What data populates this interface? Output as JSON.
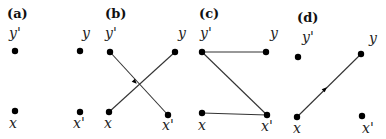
{
  "panels": [
    {
      "id": "a",
      "label": "(a)",
      "label_pos": [
        7,
        18
      ],
      "nodes": [
        {
          "name": "y'",
          "x": 15,
          "y": 51,
          "lx": 9,
          "ly": 38
        },
        {
          "name": "y",
          "x": 80,
          "y": 51,
          "lx": 82,
          "ly": 38
        },
        {
          "name": "x",
          "x": 15,
          "y": 111,
          "lx": 9,
          "ly": 128
        },
        {
          "name": "x'",
          "x": 80,
          "y": 112,
          "lx": 73,
          "ly": 128
        }
      ],
      "edges": []
    },
    {
      "id": "b",
      "label": "(b)",
      "label_pos": [
        105,
        18
      ],
      "nodes": [
        {
          "name": "y'",
          "x": 110,
          "y": 52,
          "lx": 105,
          "ly": 38
        },
        {
          "name": "y",
          "x": 175,
          "y": 52,
          "lx": 178,
          "ly": 38
        },
        {
          "name": "x",
          "x": 109,
          "y": 112,
          "lx": 104,
          "ly": 128
        },
        {
          "name": "x'",
          "x": 168,
          "y": 115,
          "lx": 162,
          "ly": 130
        }
      ],
      "edges": [
        {
          "from": "y'",
          "to": "x'",
          "arrow_at": [
            135,
            82
          ]
        },
        {
          "from": "x",
          "to": "y",
          "arrow_at": null
        }
      ]
    },
    {
      "id": "c",
      "label": "(c)",
      "label_pos": [
        199,
        18
      ],
      "nodes": [
        {
          "name": "y'",
          "x": 202,
          "y": 52,
          "lx": 200,
          "ly": 38
        },
        {
          "name": "y",
          "x": 266,
          "y": 52,
          "lx": 270,
          "ly": 38
        },
        {
          "name": "x",
          "x": 202,
          "y": 113,
          "lx": 198,
          "ly": 130
        },
        {
          "name": "x'",
          "x": 267,
          "y": 115,
          "lx": 261,
          "ly": 131
        }
      ],
      "edges": [
        {
          "from": "y'",
          "to": "y",
          "arrow_at": null
        },
        {
          "from": "y'",
          "to": "x'",
          "arrow_at": null
        },
        {
          "from": "x",
          "to": "x'",
          "arrow_at": null
        }
      ]
    },
    {
      "id": "d",
      "label": "(d)",
      "label_pos": [
        297,
        22
      ],
      "nodes": [
        {
          "name": "y'",
          "x": 298,
          "y": 57,
          "lx": 302,
          "ly": 42
        },
        {
          "name": "y",
          "x": 361,
          "y": 54,
          "lx": 369,
          "ly": 43
        },
        {
          "name": "x",
          "x": 297,
          "y": 117,
          "lx": 293,
          "ly": 133
        },
        {
          "name": "x'",
          "x": 362,
          "y": 116,
          "lx": 362,
          "ly": 133
        }
      ],
      "edges": [
        {
          "from": "x",
          "to": "y",
          "arrow_at": [
            325,
            89
          ]
        }
      ]
    }
  ]
}
